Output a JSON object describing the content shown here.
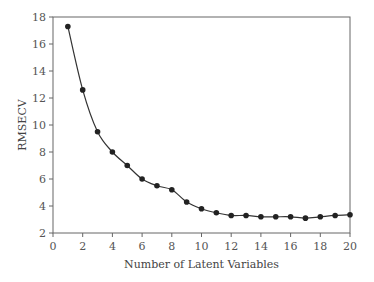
{
  "chart_data": {
    "type": "line",
    "title": "",
    "xlabel": "Number of Latent Variables",
    "ylabel": "RMSECV",
    "xlim": [
      0,
      20
    ],
    "ylim": [
      2,
      18
    ],
    "xticks": [
      0,
      2,
      4,
      6,
      8,
      10,
      12,
      14,
      16,
      18,
      20
    ],
    "yticks": [
      2,
      4,
      6,
      8,
      10,
      12,
      14,
      16,
      18
    ],
    "grid": false,
    "legend": null,
    "marker": "circle",
    "line_color": "#333333",
    "series": [
      {
        "name": "RMSECV",
        "x": [
          1,
          2,
          3,
          4,
          5,
          6,
          7,
          8,
          9,
          10,
          11,
          12,
          13,
          14,
          15,
          16,
          17,
          18,
          19,
          20
        ],
        "values": [
          17.3,
          12.6,
          9.5,
          8.0,
          7.0,
          6.0,
          5.5,
          5.2,
          4.3,
          3.8,
          3.5,
          3.3,
          3.3,
          3.2,
          3.2,
          3.2,
          3.1,
          3.2,
          3.3,
          3.35
        ]
      }
    ]
  }
}
